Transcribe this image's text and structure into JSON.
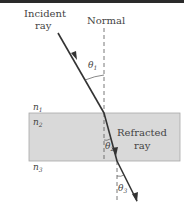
{
  "labels": {
    "incident_line1": "Incident",
    "incident_line2": "ray",
    "normal": "Normal",
    "refracted_line1": "Refracted",
    "refracted_line2": "ray",
    "n1": "n",
    "n1_sub": "1",
    "n2": "n",
    "n2_sub": "2",
    "n3": "n",
    "n3_sub": "3",
    "theta1": "θ",
    "theta1_sub": "1",
    "theta2": "θ",
    "theta2_sub": "2",
    "theta3": "θ",
    "theta3_sub": "3"
  },
  "colors": {
    "slab_fill": "#d9d9d9",
    "slab_stroke": "#a8a8a8",
    "ray": "#3a3a3a",
    "normal": "#555555"
  }
}
